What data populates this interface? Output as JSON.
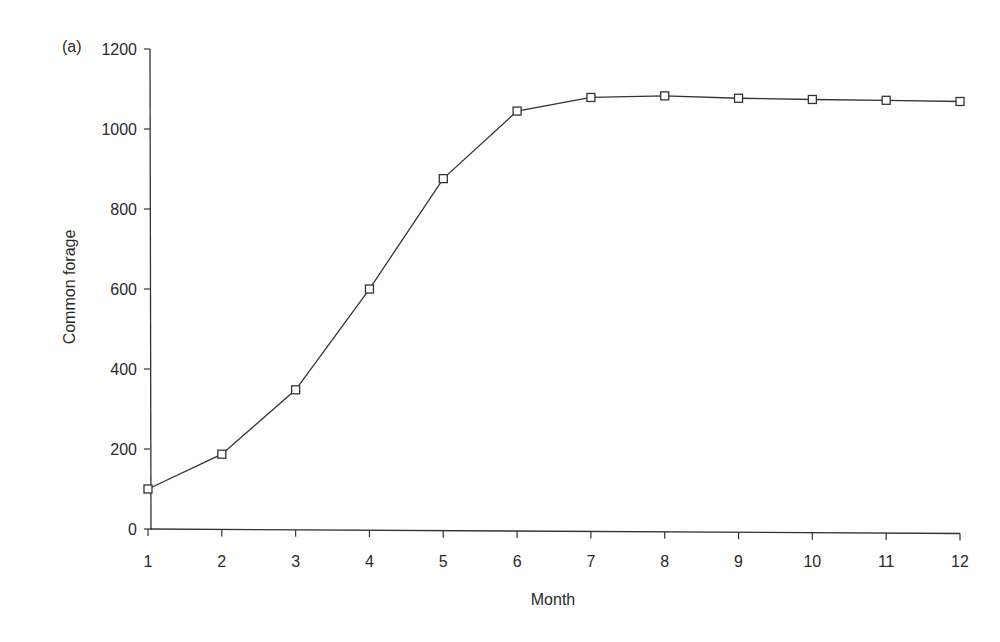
{
  "panel_label": "(a)",
  "chart_data": {
    "type": "line",
    "title": "",
    "xlabel": "Month",
    "ylabel": "Common forage",
    "x": [
      1,
      2,
      3,
      4,
      5,
      6,
      7,
      8,
      9,
      10,
      11,
      12
    ],
    "series": [
      {
        "name": "Common forage",
        "marker": "open-square",
        "values": [
          100,
          188,
          350,
          603,
          880,
          1050,
          1085,
          1090,
          1085,
          1083,
          1082,
          1080
        ]
      }
    ],
    "xticks": [
      "1",
      "2",
      "3",
      "4",
      "5",
      "6",
      "7",
      "8",
      "9",
      "10",
      "11",
      "12"
    ],
    "yticks": [
      "0",
      "200",
      "400",
      "600",
      "800",
      "1000",
      "1200"
    ],
    "ylim": [
      0,
      1200
    ],
    "xlim": [
      1,
      12
    ],
    "grid": false,
    "legend": null,
    "line_color": "#333333"
  }
}
